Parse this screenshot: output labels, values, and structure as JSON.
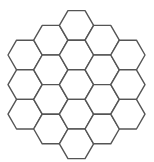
{
  "diagram": {
    "type": "hexagonal-grid",
    "orientation": "flat-top",
    "stroke_color": "#555555",
    "fill_color": "#ffffff",
    "side": 17.1,
    "hexagons": [
      {
        "col": 0,
        "cx": 25.1,
        "cy": 55
      },
      {
        "col": 0,
        "cx": 25.1,
        "cy": 84.6
      },
      {
        "col": 0,
        "cx": 25.1,
        "cy": 114.2
      },
      {
        "col": 1,
        "cx": 50.8,
        "cy": 40.2
      },
      {
        "col": 1,
        "cx": 50.8,
        "cy": 69.8
      },
      {
        "col": 1,
        "cx": 50.8,
        "cy": 99.4
      },
      {
        "col": 1,
        "cx": 50.8,
        "cy": 129
      },
      {
        "col": 2,
        "cx": 76.5,
        "cy": 25.4
      },
      {
        "col": 2,
        "cx": 76.5,
        "cy": 55
      },
      {
        "col": 2,
        "cx": 76.5,
        "cy": 84.6
      },
      {
        "col": 2,
        "cx": 76.5,
        "cy": 114.2
      },
      {
        "col": 2,
        "cx": 76.5,
        "cy": 143.8
      },
      {
        "col": 3,
        "cx": 102.2,
        "cy": 40.2
      },
      {
        "col": 3,
        "cx": 102.2,
        "cy": 69.8
      },
      {
        "col": 3,
        "cx": 102.2,
        "cy": 99.4
      },
      {
        "col": 3,
        "cx": 102.2,
        "cy": 129
      },
      {
        "col": 4,
        "cx": 127.9,
        "cy": 55
      },
      {
        "col": 4,
        "cx": 127.9,
        "cy": 84.6
      },
      {
        "col": 4,
        "cx": 127.9,
        "cy": 114.2
      }
    ]
  }
}
